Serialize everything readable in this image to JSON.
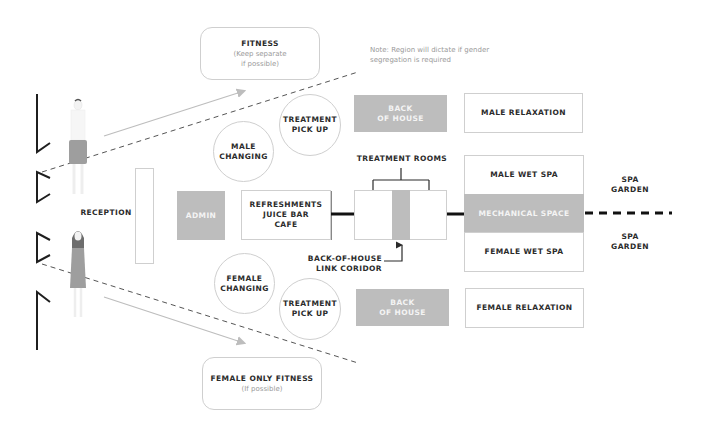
{
  "note": {
    "line1": "Note: Region will dictate if gender",
    "line2": "segregation is required"
  },
  "fitness": {
    "title": "FITNESS",
    "sub1": "(Keep separate",
    "sub2": "if possible)"
  },
  "female_fitness": {
    "title": "FEMALE ONLY FITNESS",
    "sub": "(If possible)"
  },
  "reception": "RECEPTION",
  "admin": "ADMIN",
  "male_changing": [
    "MALE",
    "CHANGING"
  ],
  "female_changing": [
    "FEMALE",
    "CHANGING"
  ],
  "treatment_pickup_top": [
    "TREATMENT",
    "PICK UP"
  ],
  "treatment_pickup_bottom": [
    "TREATMENT",
    "PICK UP"
  ],
  "refreshments": [
    "REFRESHMENTS",
    "JUICE BAR",
    "CAFE"
  ],
  "back_of_house_top": [
    "BACK",
    "OF HOUSE"
  ],
  "back_of_house_bottom": [
    "BACK",
    "OF HOUSE"
  ],
  "treatment_rooms": "TREATMENT ROOMS",
  "link_corridor": [
    "BACK-OF-HOUSE",
    "LINK CORIDOR"
  ],
  "male_relaxation": "MALE RELAXATION",
  "female_relaxation": "FEMALE RELAXATION",
  "male_wet_spa": "MALE WET SPA",
  "mechanical_space": "MECHANICAL SPACE",
  "female_wet_spa": "FEMALE WET SPA",
  "spa_garden_top": [
    "SPA",
    "GARDEN"
  ],
  "spa_garden_bottom": [
    "SPA",
    "GARDEN"
  ],
  "colors": {
    "gray_block": "#bdbdbd",
    "border": "#cfcfcf",
    "text": "#2b2b2b",
    "muted": "#9a9a9a"
  }
}
